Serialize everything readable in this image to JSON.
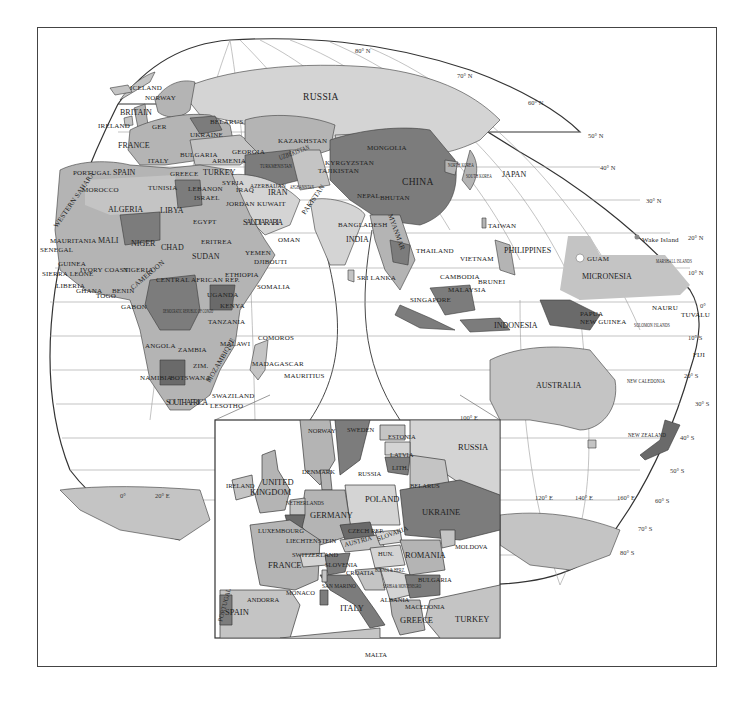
{
  "map": {
    "colors": {
      "light": "#d4d4d4",
      "mid": "#b4b4b4",
      "midlight": "#c4c4c4",
      "dark": "#7c7c7c",
      "darker": "#6a6a6a",
      "ocean": "#ffffff",
      "grid": "#9a9a9a",
      "border": "#3a3a3a"
    },
    "latitude_labels": {
      "n80": "80° N",
      "n70": "70° N",
      "n60": "60° N",
      "n50": "50° N",
      "n40": "40° N",
      "n30": "30° N",
      "n20": "20° N",
      "n10": "10° N",
      "eq": "0°",
      "s10": "10° S",
      "s20": "20° S",
      "s30": "30° S",
      "s40": "40° S",
      "s50": "50° S",
      "s60": "60° S",
      "s70": "70° S",
      "s80": "80° S"
    },
    "longitude_labels": {
      "e0": "0°",
      "e20": "20° E",
      "e100": "100° E",
      "e120": "120° E",
      "e140": "140° E",
      "e160": "160° E"
    },
    "europe_africa": {
      "iceland": "ICELAND",
      "norway": "NORWAY",
      "britain": "BRITAIN",
      "ireland": "IRELAND",
      "germany_abbr": "GER",
      "belarus": "BELARUS",
      "ukraine": "UKRAINE",
      "france": "FRANCE",
      "italy": "ITALY",
      "bulgaria": "BULGARIA",
      "georgia": "GEORGIA",
      "armenia": "ARMENIA",
      "portugal": "PORTUGAL",
      "spain": "SPAIN",
      "greece": "GREECE",
      "turkey": "TURKEY",
      "morocco": "MOROCCO",
      "tunisia": "TUNISIA",
      "lebanon": "LEBANON",
      "syria": "SYRIA",
      "iraq": "IRAQ",
      "israel": "ISRAEL",
      "jordan": "JORDAN",
      "kuwait": "KUWAIT",
      "algeria": "ALGERIA",
      "libya": "LIBYA",
      "egypt": "EGYPT",
      "western_sahara": "WESTERN SAHARA",
      "mauritania": "MAURITANIA",
      "mali": "MALI",
      "niger": "NIGER",
      "chad": "CHAD",
      "sudan": "SUDAN",
      "eritrea": "ERITREA",
      "senegal": "SENEGAL",
      "guinea": "GUINEA",
      "sierra_leone": "SIERRA LEONE",
      "liberia": "LIBERIA",
      "ivory_coast": "IVORY COAST",
      "ghana": "GHANA",
      "togo": "TOGO",
      "benin": "BENIN",
      "nigeria": "NIGERIA",
      "cameroon": "CAMEROON",
      "car": "CENTRAL AFRICAN REP.",
      "gabon": "GABON",
      "drc": "DEMOCRATIC REPUBLIC OF CONGO",
      "uganda": "UGANDA",
      "kenya": "KENYA",
      "ethiopia": "ETHIOPIA",
      "somalia": "SOMALIA",
      "djibouti": "DJIBOUTI",
      "yemen": "YEMEN",
      "oman": "OMAN",
      "saudi_arabia": "SAUDI ARABIA",
      "tanzania": "TANZANIA",
      "angola": "ANGOLA",
      "zambia": "ZAMBIA",
      "malawi": "MALAWI",
      "zimbabwe": "ZIM.",
      "mozambique": "MOZAMBIQUE",
      "namibia": "NAMIBIA",
      "botswana": "BOTSWANA",
      "south_africa": "SOUTH AFRICA",
      "swaziland": "SWAZILAND",
      "lesotho": "LESOTHO",
      "comoros": "COMOROS",
      "madagascar": "MADAGASCAR",
      "mauritius": "MAURITIUS"
    },
    "asia_pacific": {
      "russia": "RUSSIA",
      "kazakhstan": "KAZAKHSTAN",
      "mongolia": "MONGOLIA",
      "kyrgyzstan": "KYRGYZSTAN",
      "tajikistan": "TAJIKISTAN",
      "turkmenistan": "TURKMENISTAN",
      "uzbekistan": "UZBEKISTAN",
      "azerbaijan": "AZERBAIJAN",
      "iran": "IRAN",
      "afghanistan": "AFGHANISTAN",
      "pakistan": "PAKISTAN",
      "china": "CHINA",
      "north_korea": "NORTH KOREA",
      "south_korea": "SOUTH KOREA",
      "japan": "JAPAN",
      "nepal": "NEPAL",
      "bhutan": "BHUTAN",
      "bangladesh": "BANGLADESH",
      "india": "INDIA",
      "sri_lanka": "SRI LANKA",
      "myanmar": "MYANMAR",
      "taiwan": "TAIWAN",
      "thailand": "THAILAND",
      "vietnam": "VIETNAM",
      "cambodia": "CAMBODIA",
      "philippines": "PHILIPPINES",
      "brunei": "BRUNEI",
      "malaysia": "MALAYSIA",
      "singapore": "SINGAPORE",
      "indonesia": "INDONESIA",
      "papua_new_guinea": "PAPUA NEW GUINEA",
      "guam": "GUAM",
      "micronesia": "MICRONESIA",
      "wake_island": "Wake Island",
      "marshall_islands": "MARSHALL ISLANDS",
      "nauru": "NAURU",
      "tuvalu": "TUVALU",
      "solomon_islands": "SOLOMON ISLANDS",
      "fiji": "FIJI",
      "new_caledonia": "NEW CALEDONIA",
      "australia": "AUSTRALIA",
      "new_zealand": "NEW ZEALAND"
    },
    "inset": {
      "norway": "NORWAY",
      "sweden": "SWEDEN",
      "estonia": "ESTONIA",
      "russia": "RUSSIA",
      "latvia": "LATVIA",
      "denmark": "DENMARK",
      "russia_kaliningrad": "RUSSIA",
      "lithuania": "LITH.",
      "belarus": "BELARUS",
      "ireland": "IRELAND",
      "united_kingdom": "UNITED KINGDOM",
      "netherlands": "NETHERLANDS",
      "belgium": "BEL.",
      "germany": "GERMANY",
      "poland": "POLAND",
      "ukraine": "UKRAINE",
      "luxembourg": "LUXEMBOURG",
      "liechtenstein": "LIECHTENSTEIN",
      "czech": "CZECH REP.",
      "austria": "AUSTRIA",
      "slovakia": "SLOVAKIA",
      "hungary": "HUN.",
      "moldova": "MOLDOVA",
      "switzerland": "SWITZERLAND",
      "france": "FRANCE",
      "slovenia": "SLOVENIA",
      "croatia": "CROATIA",
      "romania": "ROMANIA",
      "bosnia": "BOSNIA & HERZ.",
      "serbia": "SERBIA & MONTENEGRO",
      "bulgaria": "BULGARIA",
      "san_marino": "SAN MARINO",
      "monaco": "MONACO",
      "andorra": "ANDORRA",
      "portugal": "PORTUGAL",
      "spain": "SPAIN",
      "italy": "ITALY",
      "albania": "ALBANIA",
      "macedonia": "MACEDONIA",
      "greece": "GREECE",
      "turkey": "TURKEY",
      "malta": "MALTA"
    }
  }
}
